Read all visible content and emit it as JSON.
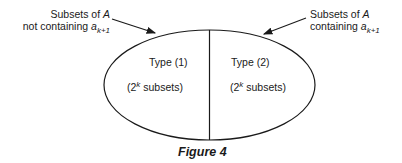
{
  "annotations": {
    "left": {
      "line1_prefix": "Subsets of ",
      "line1_var": "A",
      "line2_prefix": "not containing ",
      "line2_var": "a",
      "line2_sub": "k+1"
    },
    "right": {
      "line1_prefix": "Subsets of ",
      "line1_var": "A",
      "line2_prefix": "containing ",
      "line2_var": "a",
      "line2_sub": "k+1"
    }
  },
  "regions": [
    {
      "type_label": "Type (1)",
      "count_open": "(2",
      "count_sup": "k",
      "count_rest": " subsets)"
    },
    {
      "type_label": "Type (2)",
      "count_open": "(2",
      "count_sup": "k",
      "count_rest": " subsets)"
    }
  ],
  "caption": "Figure 4",
  "colors": {
    "stroke": "#1a1a1a",
    "background": "#ffffff"
  }
}
